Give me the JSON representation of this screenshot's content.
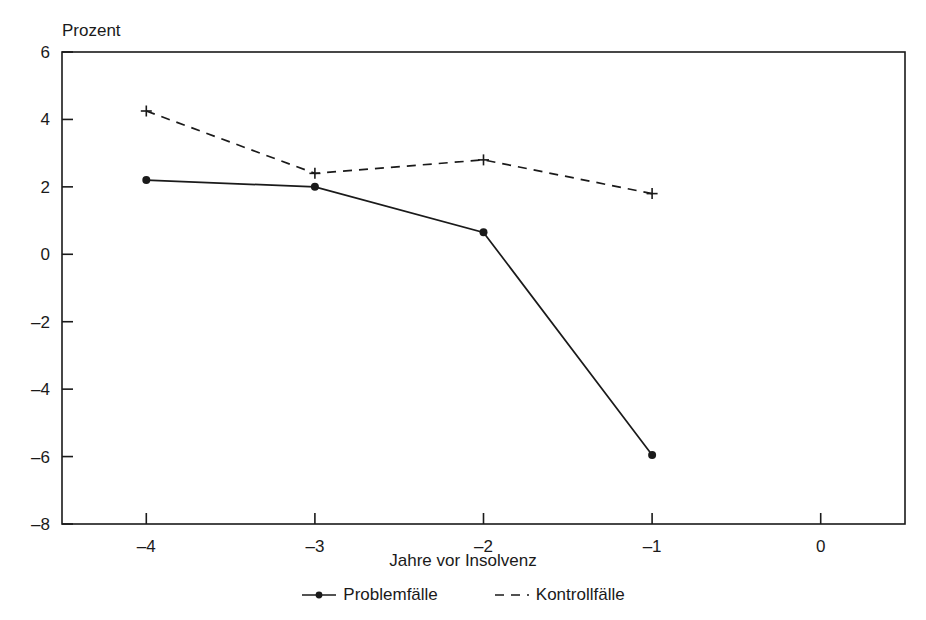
{
  "chart_data": {
    "type": "line",
    "title": "",
    "ylabel": "Prozent",
    "xlabel": "Jahre vor Insolvenz",
    "x": [
      -4,
      -3,
      -2,
      -1
    ],
    "xlim": [
      -4.5,
      0.5
    ],
    "ylim": [
      -8,
      6
    ],
    "xticks": [
      -4,
      -3,
      -2,
      -1,
      0
    ],
    "xtick_labels": [
      "–4",
      "–3",
      "–2",
      "–1",
      "0"
    ],
    "yticks": [
      6,
      4,
      2,
      0,
      -2,
      -4,
      -6,
      -8
    ],
    "ytick_labels": [
      "6",
      "4",
      "2",
      "0",
      "–2",
      "–4",
      "–6",
      "–8"
    ],
    "grid": false,
    "legend_position": "bottom",
    "series": [
      {
        "name": "Problemfälle",
        "linestyle": "solid",
        "marker": "circle",
        "color": "#1a1a1a",
        "values": [
          2.2,
          2.0,
          0.65,
          -5.95
        ]
      },
      {
        "name": "Kontrollfälle",
        "linestyle": "dashed",
        "marker": "plus",
        "color": "#1a1a1a",
        "values": [
          4.25,
          2.4,
          2.8,
          1.8
        ]
      }
    ]
  },
  "axes": {
    "frame_color": "#1a1a1a"
  },
  "legend": {
    "entries": [
      {
        "label": "Problemfälle",
        "style": "solid-dot"
      },
      {
        "label": "Kontrollfälle",
        "style": "dashed"
      }
    ]
  }
}
